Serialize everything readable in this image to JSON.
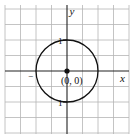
{
  "diagram": {
    "type": "coordinate-plane-circle",
    "axes": {
      "x_label": "x",
      "y_label": "y"
    },
    "tick_labels": {
      "y_top": "1",
      "y_bottom": "1",
      "x_left": "−",
      "x_right": "1"
    },
    "center_point": {
      "label": "(0, 0)",
      "x": 0,
      "y": 0
    },
    "circle": {
      "center": [
        0,
        0
      ],
      "radius": 1
    },
    "grid": {
      "cells_x": 8,
      "cells_y": 8,
      "cell_px": 15.5
    },
    "colors": {
      "grid": "#b5b5b5",
      "axis": "#222222",
      "circle": "#111111",
      "background": "#ffffff"
    }
  }
}
